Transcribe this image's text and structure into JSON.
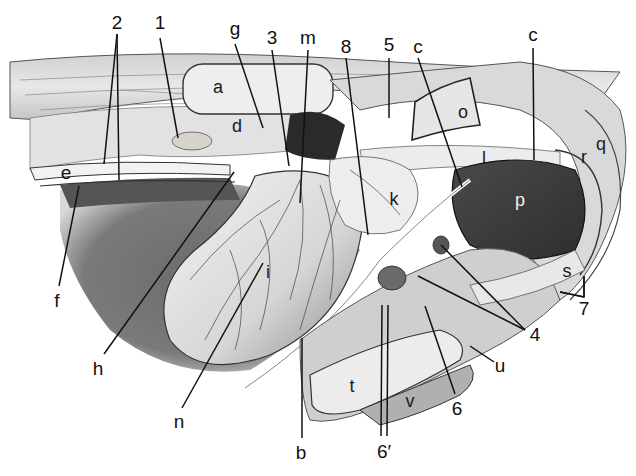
{
  "figure": {
    "type": "anatomical-illustration",
    "style": "grayscale engraving",
    "width": 636,
    "height": 476
  },
  "external_labels": [
    {
      "id": "2",
      "text": "2",
      "x": 117,
      "y": 22,
      "lines": [
        [
          117,
          34,
          104,
          164
        ],
        [
          117,
          34,
          119,
          180
        ]
      ]
    },
    {
      "id": "1",
      "text": "1",
      "x": 160,
      "y": 22,
      "lines": [
        [
          160,
          38,
          178,
          138
        ]
      ]
    },
    {
      "id": "g",
      "text": "g",
      "x": 235,
      "y": 28,
      "lines": [
        [
          235,
          44,
          263,
          128
        ]
      ]
    },
    {
      "id": "3",
      "text": "3",
      "x": 272,
      "y": 37,
      "lines": [
        [
          272,
          50,
          289,
          166
        ]
      ]
    },
    {
      "id": "m",
      "text": "m",
      "x": 308,
      "y": 37,
      "lines": [
        [
          308,
          50,
          300,
          203
        ]
      ]
    },
    {
      "id": "8",
      "text": "8",
      "x": 346,
      "y": 46,
      "lines": [
        [
          346,
          58,
          368,
          235
        ]
      ]
    },
    {
      "id": "5",
      "text": "5",
      "x": 389,
      "y": 44,
      "lines": [
        [
          389,
          58,
          389,
          118
        ]
      ]
    },
    {
      "id": "c1",
      "text": "c",
      "x": 418,
      "y": 46,
      "lines": [
        [
          418,
          58,
          462,
          187
        ]
      ]
    },
    {
      "id": "c2",
      "text": "c",
      "x": 533,
      "y": 34,
      "lines": [
        [
          533,
          48,
          534,
          160
        ]
      ]
    },
    {
      "id": "e",
      "text": "e",
      "x": 66,
      "y": 172,
      "lines": []
    },
    {
      "id": "f",
      "text": "f",
      "x": 57,
      "y": 300,
      "lines": [
        [
          59,
          286,
          79,
          186
        ]
      ]
    },
    {
      "id": "h",
      "text": "h",
      "x": 98,
      "y": 368,
      "lines": [
        [
          104,
          354,
          234,
          172
        ]
      ]
    },
    {
      "id": "n",
      "text": "n",
      "x": 179,
      "y": 421,
      "lines": [
        [
          182,
          408,
          263,
          263
        ]
      ]
    },
    {
      "id": "b",
      "text": "b",
      "x": 301,
      "y": 452,
      "lines": [
        [
          302,
          438,
          302,
          338
        ]
      ]
    },
    {
      "id": "6prime",
      "text": "6′",
      "x": 384,
      "y": 451,
      "lines": [
        [
          381,
          436,
          382,
          305
        ],
        [
          387,
          436,
          388,
          305
        ]
      ]
    },
    {
      "id": "6",
      "text": "6",
      "x": 457,
      "y": 408,
      "lines": [
        [
          455,
          394,
          425,
          306
        ]
      ]
    },
    {
      "id": "u",
      "text": "u",
      "x": 500,
      "y": 365,
      "lines": [
        [
          494,
          362,
          470,
          346
        ]
      ]
    },
    {
      "id": "4",
      "text": "4",
      "x": 535,
      "y": 334,
      "lines": [
        [
          525,
          330,
          441,
          245
        ],
        [
          525,
          330,
          418,
          276
        ]
      ]
    },
    {
      "id": "7",
      "text": "7",
      "x": 584,
      "y": 308,
      "lines": [
        [
          584,
          297,
          584,
          276
        ],
        [
          584,
          297,
          560,
          292
        ]
      ]
    }
  ],
  "internal_labels": [
    {
      "id": "a",
      "text": "a",
      "x": 218,
      "y": 87,
      "tone": "dark"
    },
    {
      "id": "d",
      "text": "d",
      "x": 237,
      "y": 126,
      "tone": "dark"
    },
    {
      "id": "o",
      "text": "o",
      "x": 463,
      "y": 112,
      "tone": "dark"
    },
    {
      "id": "l",
      "text": "l",
      "x": 484,
      "y": 158,
      "tone": "dark"
    },
    {
      "id": "r",
      "text": "r",
      "x": 584,
      "y": 157,
      "tone": "dark"
    },
    {
      "id": "q",
      "text": "q",
      "x": 601,
      "y": 144,
      "tone": "dark"
    },
    {
      "id": "k",
      "text": "k",
      "x": 394,
      "y": 199,
      "tone": "dark"
    },
    {
      "id": "p",
      "text": "p",
      "x": 520,
      "y": 200,
      "tone": "light"
    },
    {
      "id": "i",
      "text": "i",
      "x": 268,
      "y": 272,
      "tone": "dark"
    },
    {
      "id": "s",
      "text": "s",
      "x": 567,
      "y": 271,
      "tone": "dark"
    },
    {
      "id": "t",
      "text": "t",
      "x": 352,
      "y": 386,
      "tone": "dark"
    },
    {
      "id": "v",
      "text": "v",
      "x": 410,
      "y": 401,
      "tone": "dark"
    }
  ],
  "colors": {
    "background": "#ffffff",
    "tissue_light": "#e6e6e6",
    "tissue_mid": "#b8b8b8",
    "tissue_dark": "#5a5a5a",
    "shadow": "#6e6e6e",
    "organ_dark": "#3a3a3a",
    "leader_line": "#111111"
  }
}
